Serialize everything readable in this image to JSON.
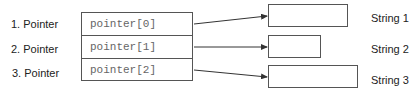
{
  "diagram": {
    "pointer_labels": [
      "1. Pointer",
      "2. Pointer",
      "3. Pointer"
    ],
    "array_cells": [
      "pointer[0]",
      "pointer[1]",
      "pointer[2]"
    ],
    "string_labels": [
      "String 1",
      "String 2",
      "String 3"
    ]
  },
  "colors": {
    "line": "#333333",
    "border": "#555555",
    "cell_text": "#666666",
    "label_text": "#222222"
  }
}
